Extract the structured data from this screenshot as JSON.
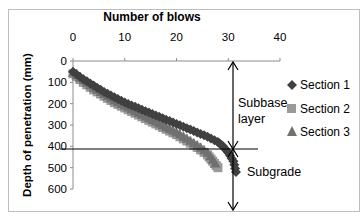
{
  "chart_data": {
    "type": "scatter",
    "title": "Number of blows",
    "xlabel": "Number of blows",
    "ylabel": "Depth of penetration (mm)",
    "x_ticks": [
      0,
      10,
      20,
      30,
      40
    ],
    "y_ticks": [
      0,
      100,
      200,
      300,
      400,
      500,
      600
    ],
    "xlim": [
      0,
      40
    ],
    "ylim": [
      0,
      600
    ],
    "x_axis_position": "top",
    "y_axis_inverted": true,
    "grid": false,
    "legend_position": "right",
    "series": [
      {
        "name": "Section 1",
        "marker": "diamond",
        "color": "#404040",
        "x": [
          0,
          2,
          4,
          6,
          8,
          10,
          12,
          14,
          16,
          18,
          20,
          22,
          24,
          26,
          28,
          29,
          30,
          31,
          31.5
        ],
        "y": [
          50,
          85,
          115,
          145,
          170,
          195,
          215,
          235,
          255,
          275,
          295,
          315,
          335,
          355,
          380,
          400,
          430,
          470,
          520
        ]
      },
      {
        "name": "Section 2",
        "marker": "square",
        "color": "#9a9a9a",
        "x": [
          0,
          2,
          4,
          6,
          8,
          10,
          12,
          14,
          16,
          18,
          20,
          22,
          24,
          26,
          27,
          28
        ],
        "y": [
          60,
          100,
          135,
          165,
          195,
          220,
          245,
          270,
          295,
          320,
          345,
          375,
          405,
          440,
          470,
          500
        ]
      },
      {
        "name": "Section 3",
        "marker": "triangle",
        "color": "#707070",
        "x": [
          0,
          2,
          4,
          6,
          8,
          10,
          12,
          14,
          16,
          18,
          20,
          22,
          24,
          26,
          27.5
        ],
        "y": [
          55,
          90,
          125,
          155,
          185,
          210,
          235,
          260,
          285,
          310,
          335,
          365,
          395,
          430,
          480
        ]
      }
    ],
    "annotations": [
      {
        "text": "Subbase layer",
        "range_mm": [
          0,
          415
        ]
      },
      {
        "text": "Subgrade",
        "range_mm": [
          415,
          600
        ]
      },
      {
        "text": "layer boundary line",
        "depth_mm": 415
      }
    ]
  },
  "labels": {
    "title": "Number of blows",
    "ylabel": "Depth of penetration (mm)",
    "x_ticks": [
      "0",
      "10",
      "20",
      "30",
      "40"
    ],
    "y_ticks": [
      "0",
      "100",
      "200",
      "300",
      "400",
      "500",
      "600"
    ],
    "legend": [
      "Section 1",
      "Section 2",
      "Section 3"
    ],
    "subbase_line1": "Subbase",
    "subbase_line2": "layer",
    "subgrade": "Subgrade"
  }
}
